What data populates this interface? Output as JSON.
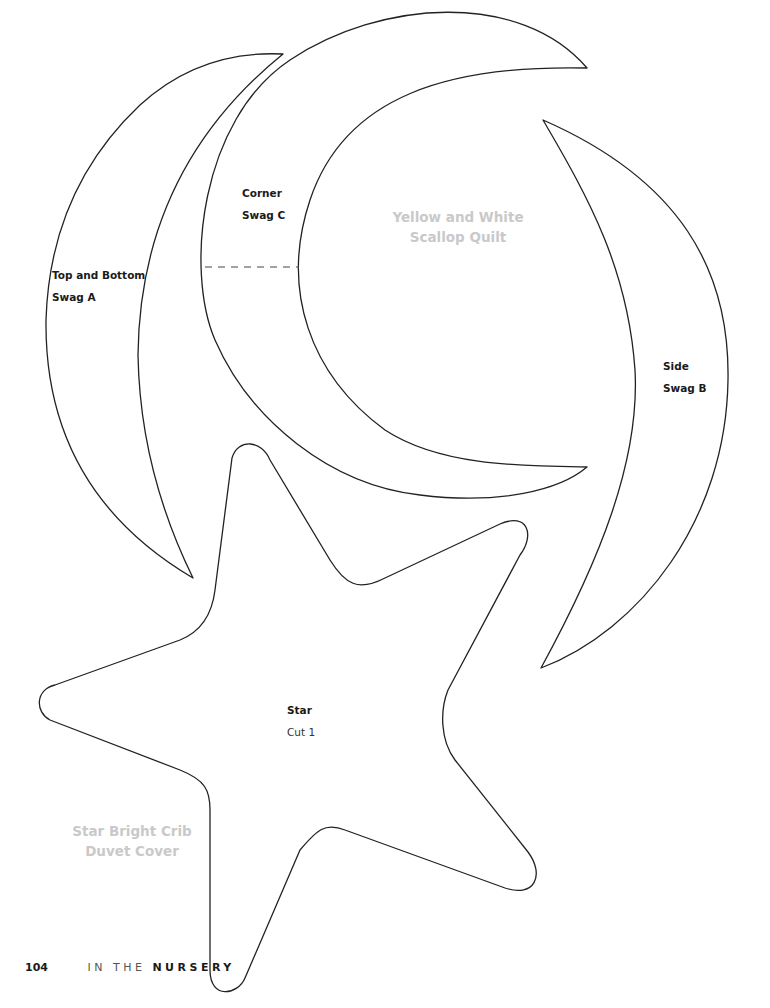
{
  "page": {
    "number": "104",
    "section_prefix": "IN THE",
    "section_name": "NURSERY"
  },
  "projects": [
    {
      "title_line1": "Yellow and White",
      "title_line2": "Scallop Quilt",
      "color": "#c9c9c9"
    },
    {
      "title_line1": "Star Bright Crib",
      "title_line2": "Duvet Cover",
      "color": "#c9c9c9"
    }
  ],
  "templates": {
    "swag_a": {
      "line1": "Top and Bottom",
      "line2": "Swag A"
    },
    "swag_b": {
      "line1": "Side",
      "line2": "Swag B"
    },
    "swag_c": {
      "line1": "Corner",
      "line2": "Swag C",
      "fold_line": "dashed"
    },
    "star": {
      "line1": "Star",
      "line2": "Cut 1"
    }
  }
}
